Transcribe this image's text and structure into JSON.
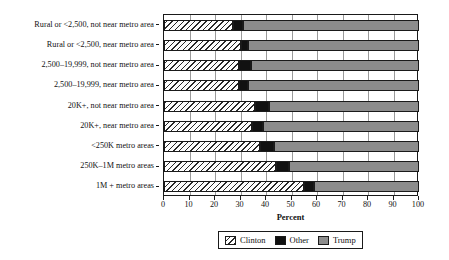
{
  "chart_data": {
    "type": "bar",
    "orientation": "horizontal",
    "stacked": true,
    "title": "",
    "xlabel": "Percent",
    "ylabel": "",
    "xlim": [
      0,
      100
    ],
    "xticks": [
      0,
      10,
      20,
      30,
      40,
      50,
      60,
      70,
      80,
      90,
      100
    ],
    "grid": "vertical",
    "legend_position": "bottom",
    "categories": [
      "Rural or <2,500, not near metro area",
      "Rural or <2,500, near metro area",
      "2,500–19,999, not near metro area",
      "2,500–19,999, near metro area",
      "20K+, not near metro area",
      "20K+, near metro area",
      "<250K metro areas",
      "250K–1M metro areas",
      "1M + metro areas"
    ],
    "series": [
      {
        "name": "Clinton",
        "color": "#ffffff",
        "pattern": "diagonal-hatch",
        "values": [
          27,
          30,
          29.5,
          29.5,
          35.5,
          34.5,
          37.5,
          44,
          55
        ]
      },
      {
        "name": "Other",
        "color": "#111111",
        "pattern": "solid",
        "values": [
          4,
          3,
          4.5,
          3.5,
          5.5,
          4.5,
          5.5,
          5,
          4
        ]
      },
      {
        "name": "Trump",
        "color": "#8c8c8c",
        "pattern": "solid",
        "values": [
          69,
          67,
          66,
          67,
          59,
          61,
          57,
          51,
          41
        ]
      }
    ]
  },
  "legend": {
    "items": [
      {
        "label": "Clinton",
        "swatch": "clinton-swatch"
      },
      {
        "label": "Other",
        "swatch": "other-swatch"
      },
      {
        "label": "Trump",
        "swatch": "trump-swatch"
      }
    ]
  },
  "colors": {
    "clinton": "#ffffff",
    "other": "#111111",
    "trump": "#8c8c8c",
    "axis": "#1a1a1a",
    "grid": "#9a9a9a"
  }
}
